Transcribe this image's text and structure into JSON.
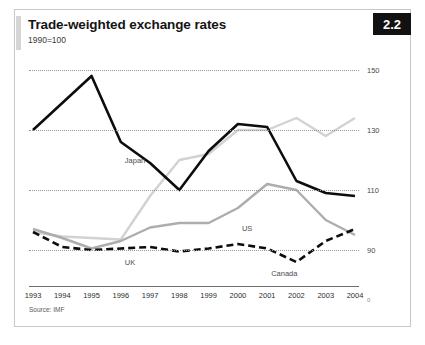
{
  "figure": {
    "badge": "2.2",
    "title": "Trade-weighted exchange rates",
    "subtitle": "1990=100",
    "source": "Source: IMF"
  },
  "chart_data": {
    "type": "line",
    "title": "Trade-weighted exchange rates",
    "subtitle": "1990=100",
    "xlabel": "",
    "ylabel": "",
    "ylim": [
      80,
      155
    ],
    "yticks": [
      150,
      130,
      110,
      90
    ],
    "zero_marker": "0",
    "grid": true,
    "legend": "inline-labels",
    "categories": [
      "1993",
      "1994",
      "1995",
      "1996",
      "1997",
      "1998",
      "1999",
      "2000",
      "2001",
      "2002",
      "2003",
      "2004"
    ],
    "series": [
      {
        "name": "Japan",
        "style": "solid-black",
        "color": "#0d0d0d",
        "label_x": "1996",
        "values": [
          130,
          139,
          148,
          126,
          119,
          110,
          123,
          132,
          131,
          113,
          109,
          108
        ]
      },
      {
        "name": "UK",
        "style": "solid-lightgray",
        "color": "#d2d2d2",
        "label_x": "1996",
        "values": [
          96,
          94.5,
          94,
          93.5,
          108,
          120,
          122,
          130,
          130,
          134,
          128,
          134
        ]
      },
      {
        "name": "US",
        "style": "solid-gray",
        "color": "#adadad",
        "label_x": "2000",
        "values": [
          97,
          94,
          90.5,
          93,
          97.5,
          99,
          99,
          104,
          112,
          110,
          100,
          95
        ]
      },
      {
        "name": "Canada",
        "style": "dashed-black",
        "color": "#0d0d0d",
        "label_x": "2001",
        "values": [
          96,
          91,
          90,
          90.5,
          91,
          89.5,
          90.5,
          92,
          90.5,
          86,
          93,
          97
        ]
      }
    ]
  }
}
